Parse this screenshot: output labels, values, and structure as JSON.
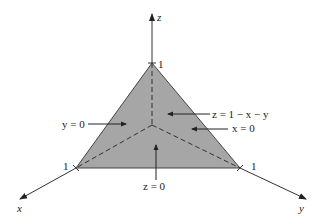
{
  "diagram": {
    "type": "3d-coordinate-plane",
    "axes": {
      "x": {
        "label": "x"
      },
      "y": {
        "label": "y"
      },
      "z": {
        "label": "z"
      }
    },
    "intercepts": {
      "x": "1",
      "y": "1",
      "z": "1"
    },
    "annotations": {
      "plane": "z = 1 − x − y",
      "y_zero": "y = 0",
      "x_zero": "x = 0",
      "z_zero": "z = 0"
    },
    "colors": {
      "face": "#a6a6a6",
      "line": "#333333"
    }
  }
}
